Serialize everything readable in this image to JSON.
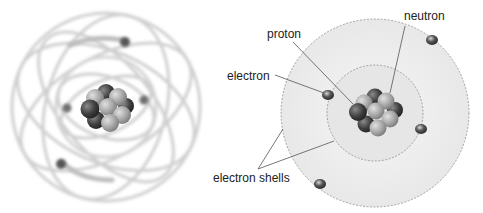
{
  "diagrams": [
    {
      "name": "atom-3d-blurred",
      "description": "Blurred 3D atom with orbit paths"
    },
    {
      "name": "atom-shell-model",
      "labels": {
        "neutron": "neutron",
        "proton": "proton",
        "electron": "electron",
        "electron_shells": "electron shells"
      }
    }
  ],
  "colors": {
    "proton": "#a8a8a8",
    "neutron": "#4a4a4a",
    "shell_fill": "#eeeeee",
    "shell_stroke": "#9a9a9a",
    "electron": "#555555",
    "leader_line": "#555555"
  }
}
